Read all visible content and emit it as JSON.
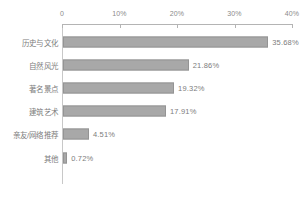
{
  "chart_data": {
    "type": "bar",
    "orientation": "horizontal",
    "title": "",
    "subtitle": "",
    "xlabel": "",
    "ylabel": "",
    "xlim": [
      0,
      40
    ],
    "grid": false,
    "legend": null,
    "legend_position": "none",
    "axis_position": "top",
    "bar_color": "#a8a8a8",
    "bar_border_color": "#949494",
    "text_color": "#7d7d7d",
    "axis_color": "#b4b4b4",
    "tick_labels": [
      "0",
      "10%",
      "20%",
      "30%",
      "40%"
    ],
    "tick_values": [
      0,
      10,
      20,
      30,
      40
    ],
    "categories": [
      "历史与文化",
      "自然风光",
      "著名景点",
      "建筑艺术",
      "亲友/网络推荐",
      "其他"
    ],
    "values": [
      35.68,
      21.86,
      19.32,
      17.91,
      4.51,
      0.72
    ],
    "value_labels": [
      "35.68%",
      "21.86%",
      "19.32%",
      "17.91%",
      "4.51%",
      "0.72%"
    ]
  }
}
